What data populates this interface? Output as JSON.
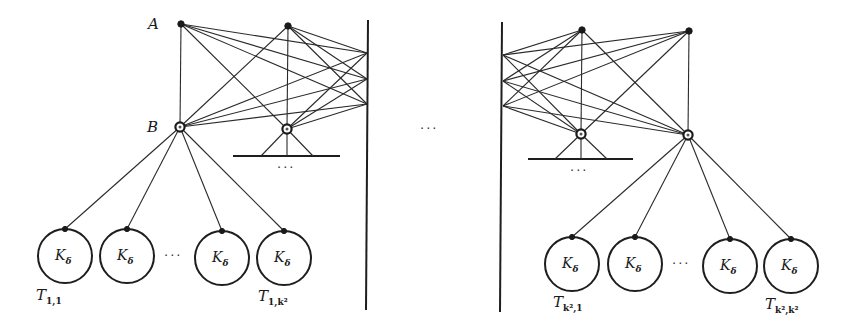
{
  "figure": {
    "colors": {
      "stroke": "#1e1e1e",
      "background": "#ffffff"
    },
    "labels": {
      "node_a": "A",
      "node_b": "B",
      "leaf_label_main": "K",
      "leaf_label_sub": "δ",
      "ellipsis": "···"
    },
    "left_group": {
      "top_nodes": [
        {
          "id": "A",
          "x": 181,
          "y": 24
        },
        {
          "id": "top2",
          "x": 288,
          "y": 26
        }
      ],
      "bottom_nodes": [
        {
          "id": "B",
          "x": 180,
          "y": 127
        },
        {
          "id": "bottom2",
          "x": 287,
          "y": 129
        }
      ],
      "wall_points": [
        {
          "x": 367,
          "y": 53
        },
        {
          "x": 367,
          "y": 79
        },
        {
          "x": 367,
          "y": 104
        }
      ],
      "bar": {
        "x1": 233,
        "x2": 340,
        "y": 156
      },
      "leaves": [
        {
          "cx": 65,
          "cy": 256,
          "label": "K_δ"
        },
        {
          "cx": 127,
          "cy": 256,
          "label": "K_δ"
        },
        {
          "cx": 222,
          "cy": 258,
          "label": "K_δ"
        },
        {
          "cx": 284,
          "cy": 258,
          "label": "K_δ"
        }
      ],
      "tree_labels": [
        {
          "main": "T",
          "sub": "1,1",
          "x": 36,
          "y": 300
        },
        {
          "main": "T",
          "sub": "1,k²",
          "x": 258,
          "y": 301
        }
      ]
    },
    "right_group": {
      "top_nodes": [
        {
          "id": "top3",
          "x": 582,
          "y": 30
        },
        {
          "id": "top4",
          "x": 689,
          "y": 31
        }
      ],
      "bottom_nodes": [
        {
          "id": "bottom3",
          "x": 581,
          "y": 134
        },
        {
          "id": "bottom4",
          "x": 688,
          "y": 135
        }
      ],
      "wall_points": [
        {
          "x": 503,
          "y": 55
        },
        {
          "x": 503,
          "y": 81
        },
        {
          "x": 503,
          "y": 106
        }
      ],
      "bar": {
        "x1": 528,
        "x2": 633,
        "y": 159
      },
      "leaves": [
        {
          "cx": 572,
          "cy": 264,
          "label": "K_δ"
        },
        {
          "cx": 635,
          "cy": 264,
          "label": "K_δ"
        },
        {
          "cx": 730,
          "cy": 266,
          "label": "K_δ"
        },
        {
          "cx": 791,
          "cy": 266,
          "label": "K_δ"
        }
      ],
      "tree_labels": [
        {
          "main": "T",
          "sub": "k²,1",
          "x": 553,
          "y": 307
        },
        {
          "main": "T",
          "sub": "k²,k²",
          "x": 765,
          "y": 309
        }
      ]
    },
    "walls": [
      {
        "x1": 368,
        "y1": 20,
        "x2": 366,
        "y2": 310
      },
      {
        "x1": 502,
        "y1": 22,
        "x2": 500,
        "y2": 312
      }
    ],
    "ellipses": [
      {
        "x": 430,
        "y": 133,
        "where": "between-groups"
      },
      {
        "x": 287,
        "y": 172,
        "where": "below-left-bar"
      },
      {
        "x": 580,
        "y": 175,
        "where": "below-right-bar"
      },
      {
        "x": 174,
        "y": 260,
        "where": "between-left-leaves"
      },
      {
        "x": 682,
        "y": 268,
        "where": "between-right-leaves"
      }
    ]
  }
}
